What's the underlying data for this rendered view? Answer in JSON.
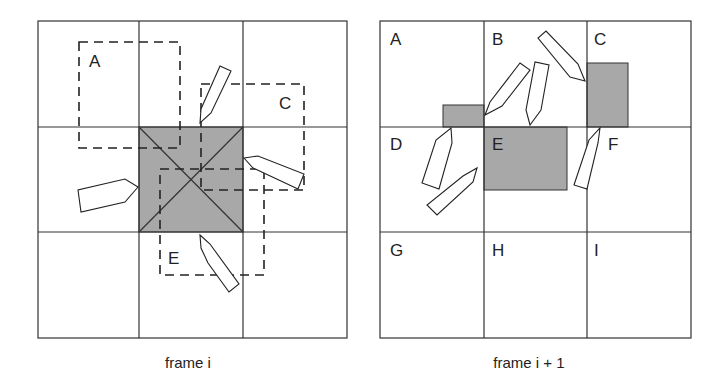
{
  "frames": [
    {
      "caption": "frame i",
      "labels": {
        "A": "A",
        "C": "C",
        "E": "E"
      }
    },
    {
      "caption": "frame i + 1",
      "labels": {
        "A": "A",
        "B": "B",
        "C": "C",
        "D": "D",
        "E": "E",
        "F": "F",
        "G": "G",
        "H": "H",
        "I": "I"
      }
    }
  ],
  "colors": {
    "shade": "#a8a8a8",
    "line": "#333333",
    "background": "#ffffff"
  }
}
